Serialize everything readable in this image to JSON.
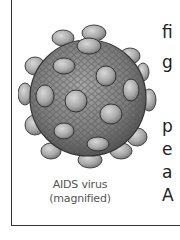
{
  "figure": {
    "illustration": "aids-virus-illustration",
    "caption_line1": "AIDS virus",
    "caption_line2": "(magnified)"
  },
  "body_text": {
    "fragments": [
      "fi",
      "g",
      "p",
      "e",
      "a",
      "A"
    ]
  },
  "colors": {
    "border": "#333333",
    "caption": "#555555",
    "text": "#222222",
    "virus_body": "#8a8a8a",
    "virus_knob": "#b0b0b0"
  }
}
